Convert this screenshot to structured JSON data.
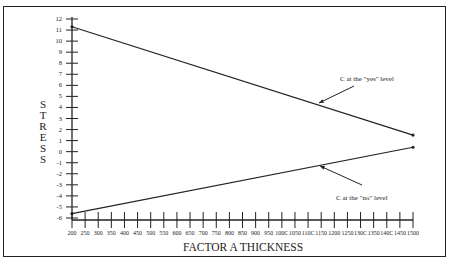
{
  "chart_data": {
    "type": "line",
    "title": "",
    "xlabel": "FACTOR  A  THICKNESS",
    "ylabel": "STRESS",
    "xlim": [
      200,
      1500
    ],
    "ylim": [
      -6,
      12
    ],
    "x_ticks": [
      200,
      250,
      300,
      350,
      400,
      450,
      500,
      550,
      600,
      650,
      700,
      750,
      800,
      850,
      900,
      950,
      1000,
      1050,
      1100,
      1150,
      1200,
      1250,
      1300,
      1350,
      1400,
      1450,
      1500
    ],
    "x_tick_labels": [
      "200",
      "250",
      "300",
      "350",
      "400",
      "450",
      "500",
      "550",
      "600",
      "650",
      "700",
      "750",
      "800",
      "850",
      "900",
      "950",
      "100C",
      "1050",
      "110C",
      "1150",
      "1200",
      "1250",
      "130C",
      "1350",
      "140C",
      "1450",
      "1500"
    ],
    "y_ticks": [
      12,
      11,
      10,
      9,
      8,
      7,
      6,
      5,
      4,
      3,
      2,
      1,
      0,
      -1,
      -2,
      -3,
      -4,
      -5,
      -6
    ],
    "grid": false,
    "series": [
      {
        "name": "C at the \"yes\" level",
        "x": [
          200,
          1500
        ],
        "values": [
          11.3,
          1.5
        ]
      },
      {
        "name": "C at the \"no\" level",
        "x": [
          200,
          1500
        ],
        "values": [
          -5.6,
          0.4
        ]
      }
    ],
    "annotations": [
      {
        "text": "C at the \"yes\" level",
        "points_to_series": 0
      },
      {
        "text": "C at the \"no\" level",
        "points_to_series": 1
      }
    ]
  },
  "labels": {
    "ylabel_letters": [
      "S",
      "T",
      "R",
      "E",
      "S",
      "S"
    ],
    "xlabel": "FACTOR  A  THICKNESS",
    "annotation_yes": "C at the \"yes\" level",
    "annotation_no": "C at the \"no\" level",
    "caption": "Figure 4: Factor ... (cut off)"
  }
}
